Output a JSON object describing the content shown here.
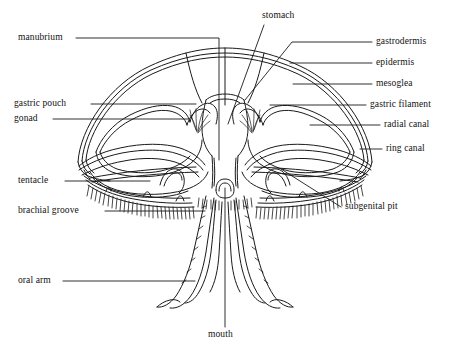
{
  "figure": {
    "line_color": "#1a1a1a",
    "background_color": "#ffffff",
    "text_color": "#111111"
  },
  "labels": {
    "manubrium": "manubrium",
    "gastric_pouch": "gastric pouch",
    "gonad": "gonad",
    "tentacle": "tentacle",
    "brachial_groove": "brachial groove",
    "oral_arm": "oral arm",
    "stomach": "stomach",
    "gastrodermis": "gastrodermis",
    "epidermis": "epidermis",
    "mesoglea": "mesoglea",
    "gastric_filament": "gastric filament",
    "radial_canal": "radial canal",
    "ring_canal": "ring canal",
    "subgenital_pit": "subgenital pit",
    "mouth": "mouth"
  }
}
